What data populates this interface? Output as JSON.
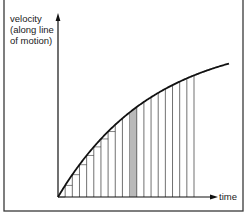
{
  "figure": {
    "y_axis_label_lines": [
      "velocity",
      "(along line",
      "of motion)"
    ],
    "x_axis_label": "time"
  },
  "chart_data": {
    "type": "area",
    "title": "",
    "xlabel": "time",
    "ylabel": "velocity (along line of motion)",
    "curve": "v = V(1 - e^(-k t))",
    "strip_count": 19,
    "highlighted_strip_index": 10,
    "grid": false,
    "axis_ticks": false,
    "colors": {
      "curve": "#111111",
      "strips": "#333333",
      "highlight_fill": "#b9b9b9",
      "frame": "#333333"
    }
  }
}
